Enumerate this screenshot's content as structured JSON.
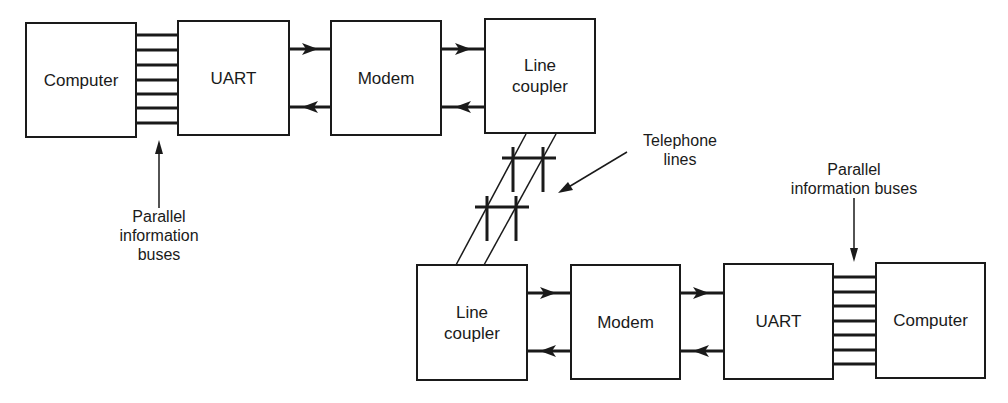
{
  "figure": {
    "top_chain": {
      "blocks": [
        {
          "id": "computer",
          "label": "Computer"
        },
        {
          "id": "uart",
          "label": "UART"
        },
        {
          "id": "modem",
          "label": "Modem"
        },
        {
          "id": "line_coupler",
          "label": "Line\ncoupler"
        }
      ],
      "bus_label": "Parallel\ninformation\nbuses"
    },
    "bottom_chain": {
      "blocks": [
        {
          "id": "line_coupler",
          "label": "Line\ncoupler"
        },
        {
          "id": "modem",
          "label": "Modem"
        },
        {
          "id": "uart",
          "label": "UART"
        },
        {
          "id": "computer",
          "label": "Computer"
        }
      ],
      "bus_label": "Parallel\ninformation buses"
    },
    "telephone_label": "Telephone\nlines",
    "bus_line_count": 7,
    "colors": {
      "ink": "#1a1a1a",
      "background": "#ffffff"
    }
  }
}
